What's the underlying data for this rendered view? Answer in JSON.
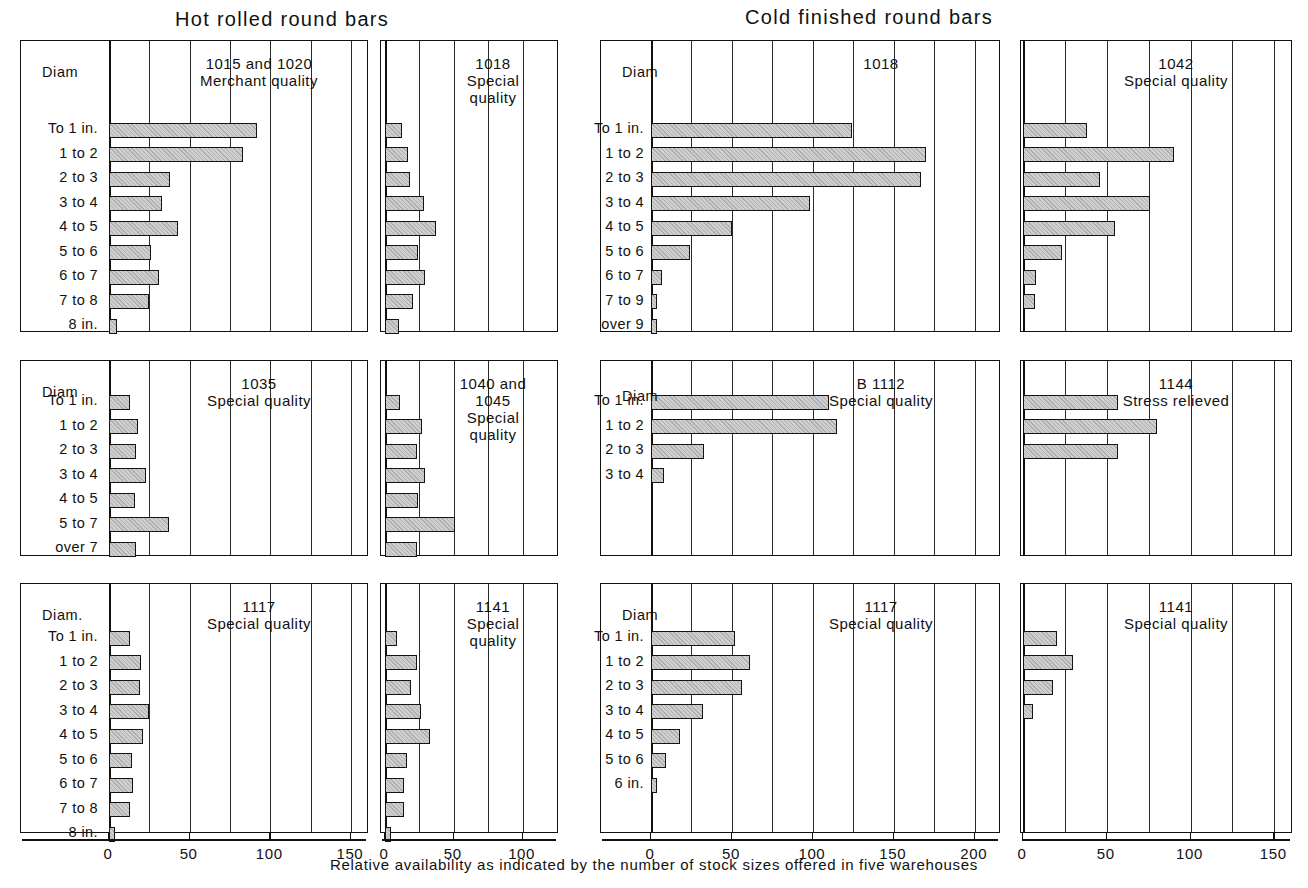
{
  "figure": {
    "caption": "Relative availability as indicated by the number of stock sizes offered in five warehouses",
    "group_titles": [
      {
        "label": "Hot rolled round bars"
      },
      {
        "label": "Cold finished round bars"
      }
    ],
    "diam_header": "Diam",
    "diam_header_dotted": "Diam."
  },
  "chart_data": {
    "type": "bar",
    "xlabel": "Relative availability as indicated by the number of stock sizes offered in five warehouses",
    "ylabel": "Diam",
    "grid": true,
    "orientation": "horizontal",
    "legend": "none",
    "panels": [
      {
        "id": "hot-1015-1020",
        "group": "Hot rolled round bars",
        "title": "1015 and 1020\nMerchant quality",
        "title_lines": [
          "1015 and 1020",
          "Merchant quality"
        ],
        "row_header": "Diam",
        "xlim": [
          0,
          160
        ],
        "xticks": [
          0,
          50,
          100,
          150
        ],
        "xtick_labels": [
          "0",
          "50",
          "100",
          "150"
        ],
        "gridstep": 25,
        "categories": [
          "To 1 in.",
          "1 to 2",
          "2 to 3",
          "3 to 4",
          "4 to 5",
          "5 to 6",
          "6 to 7",
          "7 to 8",
          "8 in."
        ],
        "values": [
          92,
          83,
          38,
          33,
          43,
          26,
          31,
          25,
          5
        ]
      },
      {
        "id": "hot-1018",
        "group": "Hot rolled round bars",
        "title": "1018\nSpecial\nquality",
        "title_lines": [
          "1018",
          "Special",
          "quality"
        ],
        "row_header": "",
        "xlim": [
          0,
          125
        ],
        "xticks": [
          0,
          50,
          100
        ],
        "xtick_labels": [
          "0",
          "50",
          "100"
        ],
        "gridstep": 25,
        "categories": [
          "To 1 in.",
          "1 to 2",
          "2 to 3",
          "3 to 4",
          "4 to 5",
          "5 to 6",
          "6 to 7",
          "7 to 8",
          "8 in."
        ],
        "values": [
          12,
          17,
          18,
          28,
          37,
          24,
          29,
          20,
          10
        ]
      },
      {
        "id": "cold-1018",
        "group": "Cold finished round bars",
        "title": "1018",
        "title_lines": [
          "1018"
        ],
        "row_header": "Diam",
        "xlim": [
          0,
          215
        ],
        "xticks": [
          0,
          50,
          100,
          150,
          200
        ],
        "xtick_labels": [
          "0",
          "50",
          "100",
          "150",
          "200"
        ],
        "gridstep": 25,
        "categories": [
          "To 1 in.",
          "1 to 2",
          "2 to 3",
          "3 to 4",
          "4 to 5",
          "5 to 6",
          "6 to 7",
          "7 to 9",
          "over 9"
        ],
        "values": [
          124,
          170,
          167,
          98,
          50,
          24,
          7,
          3,
          3
        ]
      },
      {
        "id": "cold-1042",
        "group": "Cold finished round bars",
        "title": "1042\nSpecial quality",
        "title_lines": [
          "1042",
          "Special quality"
        ],
        "row_header": "",
        "xlim": [
          0,
          160
        ],
        "xticks": [
          0,
          50,
          100,
          150
        ],
        "xtick_labels": [
          "0",
          "50",
          "100",
          "150"
        ],
        "gridstep": 25,
        "categories": [
          "To 1 in.",
          "1 to 2",
          "2 to 3",
          "3 to 4",
          "4 to 5",
          "5 to 6",
          "6 to 7",
          "7 to 9"
        ],
        "values": [
          38,
          90,
          46,
          76,
          55,
          23,
          8,
          7
        ]
      },
      {
        "id": "hot-1035",
        "group": "Hot rolled round bars",
        "title": "1035\nSpecial quality",
        "title_lines": [
          "1035",
          "Special quality"
        ],
        "row_header": "Diam",
        "xlim": [
          0,
          160
        ],
        "xticks": [
          0,
          50,
          100,
          150
        ],
        "xtick_labels": [
          "0",
          "50",
          "100",
          "150"
        ],
        "gridstep": 25,
        "categories": [
          "To 1 in.",
          "1 to 2",
          "2 to 3",
          "3 to 4",
          "4 to 5",
          "5 to 7",
          "over 7"
        ],
        "values": [
          13,
          18,
          17,
          23,
          16,
          37,
          17
        ]
      },
      {
        "id": "hot-1040-1045",
        "group": "Hot rolled round bars",
        "title": "1040 and\n1045\nSpecial\nquality",
        "title_lines": [
          "1040 and",
          "1045",
          "Special",
          "quality"
        ],
        "row_header": "",
        "xlim": [
          0,
          125
        ],
        "xticks": [
          0,
          50,
          100
        ],
        "xtick_labels": [
          "0",
          "50",
          "100"
        ],
        "gridstep": 25,
        "categories": [
          "To 1 in.",
          "1 to 2",
          "2 to 3",
          "3 to 4",
          "4 to 5",
          "5 to 7",
          "over 7"
        ],
        "values": [
          11,
          27,
          23,
          29,
          24,
          51,
          23
        ]
      },
      {
        "id": "cold-b1112",
        "group": "Cold finished round bars",
        "title": "B 1112\nSpecial quality",
        "title_lines": [
          "B 1112",
          "Special quality"
        ],
        "row_header": "Diam",
        "xlim": [
          0,
          215
        ],
        "xticks": [
          0,
          50,
          100,
          150,
          200
        ],
        "xtick_labels": [
          "0",
          "50",
          "100",
          "150",
          "200"
        ],
        "gridstep": 25,
        "categories": [
          "To 1 in.",
          "1 to 2",
          "2 to 3",
          "3 to 4"
        ],
        "values": [
          110,
          115,
          33,
          8
        ]
      },
      {
        "id": "cold-1144",
        "group": "Cold finished round bars",
        "title": "1144\nStress relieved",
        "title_lines": [
          "1144",
          "Stress relieved"
        ],
        "row_header": "",
        "xlim": [
          0,
          160
        ],
        "xticks": [
          0,
          50,
          100,
          150
        ],
        "xtick_labels": [
          "0",
          "50",
          "100",
          "150"
        ],
        "gridstep": 25,
        "categories": [
          "To 1 in.",
          "1 to 2",
          "2 to 3"
        ],
        "values": [
          57,
          80,
          57
        ]
      },
      {
        "id": "hot-1117",
        "group": "Hot rolled round bars",
        "title": "1117\nSpecial quality",
        "title_lines": [
          "1117",
          "Special quality"
        ],
        "row_header": "Diam.",
        "xlim": [
          0,
          160
        ],
        "xticks": [
          0,
          50,
          100,
          150
        ],
        "xtick_labels": [
          "0",
          "50",
          "100",
          "150"
        ],
        "gridstep": 25,
        "categories": [
          "To 1 in.",
          "1 to 2",
          "2 to 3",
          "3 to 4",
          "4 to 5",
          "5 to 6",
          "6 to 7",
          "7 to 8",
          "8 in."
        ],
        "values": [
          13,
          20,
          19,
          25,
          21,
          14,
          15,
          13,
          3
        ]
      },
      {
        "id": "hot-1141",
        "group": "Hot rolled round bars",
        "title": "1141\nSpecial\nquality",
        "title_lines": [
          "1141",
          "Special",
          "quality"
        ],
        "row_header": "",
        "xlim": [
          0,
          125
        ],
        "xticks": [
          0,
          50,
          100
        ],
        "xtick_labels": [
          "0",
          "50",
          "100"
        ],
        "gridstep": 25,
        "categories": [
          "To 1 in.",
          "1 to 2",
          "2 to 3",
          "3 to 4",
          "4 to 5",
          "5 to 6",
          "6 to 7",
          "7 to 8",
          "8 in."
        ],
        "values": [
          9,
          23,
          19,
          26,
          33,
          16,
          14,
          14,
          4
        ]
      },
      {
        "id": "cold-1117",
        "group": "Cold finished round bars",
        "title": "1117\nSpecial quality",
        "title_lines": [
          "1117",
          "Special quality"
        ],
        "row_header": "Diam",
        "xlim": [
          0,
          215
        ],
        "xticks": [
          0,
          50,
          100,
          150,
          200
        ],
        "xtick_labels": [
          "0",
          "50",
          "100",
          "150",
          "200"
        ],
        "gridstep": 25,
        "categories": [
          "To 1 in.",
          "1 to 2",
          "2 to 3",
          "3 to 4",
          "4 to 5",
          "5 to 6",
          "6 in."
        ],
        "values": [
          52,
          61,
          56,
          32,
          18,
          9,
          3
        ]
      },
      {
        "id": "cold-1141",
        "group": "Cold finished round bars",
        "title": "1141\nSpecial quality",
        "title_lines": [
          "1141",
          "Special quality"
        ],
        "row_header": "",
        "xlim": [
          0,
          160
        ],
        "xticks": [
          0,
          50,
          100,
          150
        ],
        "xtick_labels": [
          "0",
          "50",
          "100",
          "150"
        ],
        "gridstep": 25,
        "categories": [
          "To 1 in.",
          "1 to 2",
          "2 to 3",
          "3 to 4"
        ],
        "values": [
          20,
          30,
          18,
          6
        ]
      }
    ]
  },
  "colors": {
    "ink": "#111111",
    "bar_fill": "#cfcfcf",
    "grid": "#2a2a2a",
    "background": "#ffffff"
  }
}
